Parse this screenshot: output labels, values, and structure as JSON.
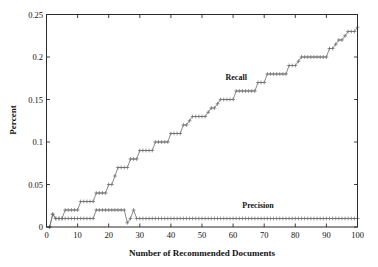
{
  "figure": {
    "background_color": "#ffffff",
    "axis_color": "#2b2b2b",
    "series_color": "#6e6e6e"
  },
  "chart_data": {
    "type": "line",
    "title": "",
    "subtitle": "",
    "xlabel": "Number of Recommended Documents",
    "ylabel": "Percent",
    "xlim": [
      0,
      100
    ],
    "ylim": [
      0,
      0.25
    ],
    "xticks": [
      0,
      10,
      20,
      30,
      40,
      50,
      60,
      70,
      80,
      90,
      100
    ],
    "xticklabels": [
      "0",
      "10",
      "20",
      "30",
      "40",
      "50",
      "60",
      "70",
      "80",
      "90",
      "100"
    ],
    "yticks": [
      0,
      0.05,
      0.1,
      0.15,
      0.2,
      0.25
    ],
    "yticklabels": [
      "0",
      "0.05",
      "0.1",
      "0.15",
      "0.2",
      "0.25"
    ],
    "grid": false,
    "legend": "inline-annotations",
    "marker": "+",
    "annotations": [
      {
        "text": "Recall",
        "x": 61,
        "y": 0.173
      },
      {
        "text": "Precision",
        "x": 68,
        "y": 0.022
      }
    ],
    "x": [
      1,
      2,
      3,
      4,
      5,
      6,
      7,
      8,
      9,
      10,
      11,
      12,
      13,
      14,
      15,
      16,
      17,
      18,
      19,
      20,
      21,
      22,
      23,
      24,
      25,
      26,
      27,
      28,
      29,
      30,
      31,
      32,
      33,
      34,
      35,
      36,
      37,
      38,
      39,
      40,
      41,
      42,
      43,
      44,
      45,
      46,
      47,
      48,
      49,
      50,
      51,
      52,
      53,
      54,
      55,
      56,
      57,
      58,
      59,
      60,
      61,
      62,
      63,
      64,
      65,
      66,
      67,
      68,
      69,
      70,
      71,
      72,
      73,
      74,
      75,
      76,
      77,
      78,
      79,
      80,
      81,
      82,
      83,
      84,
      85,
      86,
      87,
      88,
      89,
      90,
      91,
      92,
      93,
      94,
      95,
      96,
      97,
      98,
      99,
      100
    ],
    "series": [
      {
        "name": "Recall",
        "marker": "+",
        "values": [
          0.0,
          0.015,
          0.01,
          0.01,
          0.01,
          0.02,
          0.02,
          0.02,
          0.02,
          0.02,
          0.03,
          0.03,
          0.03,
          0.03,
          0.03,
          0.04,
          0.04,
          0.04,
          0.04,
          0.05,
          0.05,
          0.06,
          0.07,
          0.07,
          0.07,
          0.07,
          0.08,
          0.08,
          0.08,
          0.09,
          0.09,
          0.09,
          0.09,
          0.09,
          0.1,
          0.1,
          0.1,
          0.1,
          0.1,
          0.11,
          0.11,
          0.11,
          0.11,
          0.12,
          0.12,
          0.125,
          0.13,
          0.13,
          0.13,
          0.13,
          0.13,
          0.135,
          0.14,
          0.14,
          0.145,
          0.15,
          0.15,
          0.15,
          0.15,
          0.15,
          0.16,
          0.16,
          0.16,
          0.16,
          0.16,
          0.16,
          0.16,
          0.17,
          0.17,
          0.17,
          0.18,
          0.18,
          0.18,
          0.18,
          0.18,
          0.18,
          0.18,
          0.19,
          0.19,
          0.19,
          0.195,
          0.2,
          0.2,
          0.2,
          0.2,
          0.2,
          0.2,
          0.2,
          0.2,
          0.2,
          0.21,
          0.21,
          0.215,
          0.22,
          0.22,
          0.225,
          0.23,
          0.23,
          0.23,
          0.235
        ]
      },
      {
        "name": "Precision",
        "marker": "+",
        "values": [
          0.0,
          0.015,
          0.01,
          0.01,
          0.01,
          0.01,
          0.01,
          0.01,
          0.01,
          0.01,
          0.01,
          0.01,
          0.01,
          0.01,
          0.01,
          0.02,
          0.02,
          0.02,
          0.02,
          0.02,
          0.02,
          0.02,
          0.02,
          0.02,
          0.02,
          0.005,
          0.01,
          0.02,
          0.01,
          0.01,
          0.01,
          0.01,
          0.01,
          0.01,
          0.01,
          0.01,
          0.01,
          0.01,
          0.01,
          0.01,
          0.01,
          0.01,
          0.01,
          0.01,
          0.01,
          0.01,
          0.01,
          0.01,
          0.01,
          0.01,
          0.01,
          0.01,
          0.01,
          0.01,
          0.01,
          0.01,
          0.01,
          0.01,
          0.01,
          0.01,
          0.01,
          0.01,
          0.01,
          0.01,
          0.01,
          0.01,
          0.01,
          0.01,
          0.01,
          0.01,
          0.01,
          0.01,
          0.01,
          0.01,
          0.01,
          0.01,
          0.01,
          0.01,
          0.01,
          0.01,
          0.01,
          0.01,
          0.01,
          0.01,
          0.01,
          0.01,
          0.01,
          0.01,
          0.01,
          0.01,
          0.01,
          0.01,
          0.01,
          0.01,
          0.01,
          0.01,
          0.01,
          0.01,
          0.01,
          0.01
        ]
      }
    ]
  }
}
